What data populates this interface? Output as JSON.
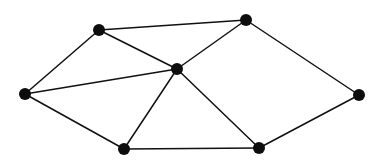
{
  "figure": {
    "kind": "undirected-graph-diagram",
    "width": 385,
    "height": 165,
    "background_color": "#ffffff",
    "title": "",
    "caption": "",
    "vertex_count": 7,
    "edge_count": 11
  },
  "style": {
    "vertex_color": "#0d0d0d",
    "vertex_radius": 6,
    "edge_color": "#111111",
    "edge_width": 1.5,
    "edge_style": "solid",
    "labels_visible": false
  },
  "chart_data": {
    "type": "diagram",
    "title": "",
    "xlabel": "",
    "ylabel": "",
    "nodes": [
      {
        "id": "v1",
        "name": "left-vertex",
        "x": 25,
        "y": 94,
        "degree": 3,
        "label": ""
      },
      {
        "id": "v2",
        "name": "top-left-vertex",
        "x": 99,
        "y": 30,
        "degree": 3,
        "label": ""
      },
      {
        "id": "v3",
        "name": "top-right-vertex",
        "x": 246,
        "y": 20,
        "degree": 3,
        "label": ""
      },
      {
        "id": "v4",
        "name": "center-vertex",
        "x": 177,
        "y": 69,
        "degree": 5,
        "label": ""
      },
      {
        "id": "v5",
        "name": "right-vertex",
        "x": 359,
        "y": 95,
        "degree": 2,
        "label": ""
      },
      {
        "id": "v6",
        "name": "bottom-left-vertex",
        "x": 124,
        "y": 149,
        "degree": 3,
        "label": ""
      },
      {
        "id": "v7",
        "name": "bottom-right-vertex",
        "x": 259,
        "y": 148,
        "degree": 3,
        "label": ""
      }
    ],
    "edges": [
      {
        "id": "e1",
        "source": "v1",
        "target": "v2",
        "label": ""
      },
      {
        "id": "e2",
        "source": "v1",
        "target": "v4",
        "label": ""
      },
      {
        "id": "e3",
        "source": "v1",
        "target": "v6",
        "label": ""
      },
      {
        "id": "e4",
        "source": "v2",
        "target": "v3",
        "label": ""
      },
      {
        "id": "e5",
        "source": "v2",
        "target": "v4",
        "label": ""
      },
      {
        "id": "e6",
        "source": "v3",
        "target": "v4",
        "label": ""
      },
      {
        "id": "e7",
        "source": "v3",
        "target": "v5",
        "label": ""
      },
      {
        "id": "e8",
        "source": "v4",
        "target": "v6",
        "label": ""
      },
      {
        "id": "e9",
        "source": "v4",
        "target": "v7",
        "label": ""
      },
      {
        "id": "e10",
        "source": "v6",
        "target": "v7",
        "label": ""
      },
      {
        "id": "e11",
        "source": "v7",
        "target": "v5",
        "label": ""
      }
    ]
  }
}
